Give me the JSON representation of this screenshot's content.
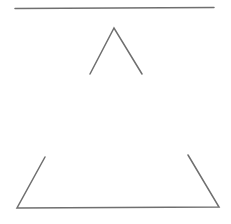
{
  "canvas": {
    "width": 231,
    "height": 224,
    "background": "#ffffff",
    "stroke_color": "#6f6f6f",
    "stroke_width": 1.5
  },
  "shapes": {
    "top_line": {
      "x1": 15,
      "y1": 8.5,
      "x2": 214,
      "y2": 7.5
    },
    "chevron": {
      "points": "90,74 114,28 142,74"
    },
    "bottom_bracket": {
      "points": "45,157 17,208 219,207 188,155"
    }
  }
}
